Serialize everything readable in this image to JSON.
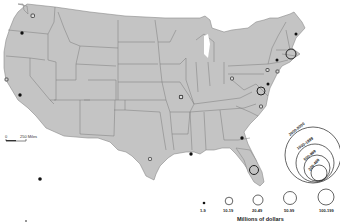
{
  "map": {
    "region": "United States",
    "fill_color": "#c4c4c4",
    "border_color": "#7a7a7a",
    "symbols": [
      {
        "name": "washington-north",
        "x": 33,
        "y": 16,
        "class": "1-9",
        "style": "small-square"
      },
      {
        "name": "oregon-portland",
        "x": 22,
        "y": 33,
        "class": "1-9",
        "style": "dot"
      },
      {
        "name": "california-sf",
        "x": 6,
        "y": 80,
        "class": "1-9",
        "style": "small-square"
      },
      {
        "name": "california-la",
        "x": 20,
        "y": 95,
        "class": "1-9",
        "style": "dot"
      },
      {
        "name": "missouri",
        "x": 181,
        "y": 97,
        "class": "1-9",
        "style": "small-square"
      },
      {
        "name": "texas-houston",
        "x": 150,
        "y": 159,
        "class": "1-9",
        "style": "small-square"
      },
      {
        "name": "louisiana",
        "x": 191,
        "y": 154,
        "class": "1-9",
        "style": "dot"
      },
      {
        "name": "georgia-atlanta",
        "x": 242,
        "y": 138,
        "class": "1-9",
        "style": "dot"
      },
      {
        "name": "florida",
        "x": 254,
        "y": 170,
        "class": "10-19",
        "style": "circle",
        "r": 5
      },
      {
        "name": "maine",
        "x": 296,
        "y": 34,
        "class": "1-9",
        "style": "dot"
      },
      {
        "name": "massachusetts-boston",
        "x": 291,
        "y": 55,
        "class": "20-49",
        "style": "circle",
        "r": 5.5
      },
      {
        "name": "new-york-albany",
        "x": 277,
        "y": 59,
        "class": "1-9",
        "style": "dot"
      },
      {
        "name": "new-york-nyc",
        "x": 277,
        "y": 72,
        "class": "1-9",
        "style": "small-square"
      },
      {
        "name": "pennsylvania",
        "x": 267,
        "y": 70,
        "class": "1-9",
        "style": "small-square"
      },
      {
        "name": "maryland",
        "x": 268,
        "y": 84,
        "class": "1-9",
        "style": "dot"
      },
      {
        "name": "virginia",
        "x": 261,
        "y": 92,
        "class": "10-19",
        "style": "circle",
        "r": 4.5
      },
      {
        "name": "ohio",
        "x": 232,
        "y": 78,
        "class": "1-9",
        "style": "small-square"
      },
      {
        "name": "north-carolina",
        "x": 261,
        "y": 106,
        "class": "1-9",
        "style": "small-square"
      },
      {
        "name": "kentucky-tennessee",
        "x": 181,
        "y": 97,
        "class": "1-9",
        "style": "small-square"
      },
      {
        "name": "oklahoma-area",
        "x": 181,
        "y": 97,
        "class": "1-9",
        "style": "small-square"
      },
      {
        "name": "arkansas-area",
        "x": 181,
        "y": 97,
        "class": "1-9",
        "style": "small-square"
      },
      {
        "name": "hawaii",
        "x": 40,
        "y": 179,
        "class": "1-9",
        "style": "dot"
      },
      {
        "name": "alaska-mark",
        "x": 26,
        "y": 220,
        "class": "1-9",
        "style": "dot-small"
      }
    ]
  },
  "scale_bar": {
    "start_label": "0",
    "end_label": "250 Miles"
  },
  "legend": {
    "title": "Millions of dollars",
    "small_classes": [
      {
        "label": "1-9",
        "r": 1.3,
        "cx": 204
      },
      {
        "label": "10-19",
        "r": 4,
        "cx": 229
      },
      {
        "label": "20-49",
        "r": 5,
        "cx": 258
      },
      {
        "label": "50-99",
        "r": 6.5,
        "cx": 290
      },
      {
        "label": "100-199",
        "r": 8,
        "cx": 326
      }
    ],
    "nested_classes": [
      {
        "label": "200-499",
        "r": 8
      },
      {
        "label": "500-999",
        "r": 13
      },
      {
        "label": "1000-1999",
        "r": 19
      },
      {
        "label": "2000-5000",
        "r": 29
      }
    ]
  }
}
